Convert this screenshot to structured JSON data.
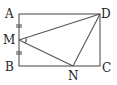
{
  "diagram": {
    "type": "geometry",
    "points": {
      "A": {
        "label": "A",
        "x": 19,
        "y": 14
      },
      "D": {
        "label": "D",
        "x": 100,
        "y": 14
      },
      "B": {
        "label": "B",
        "x": 19,
        "y": 66
      },
      "C": {
        "label": "C",
        "x": 100,
        "y": 66
      },
      "M": {
        "label": "M",
        "x": 19,
        "y": 40
      },
      "N": {
        "label": "N",
        "x": 73,
        "y": 66
      }
    },
    "segments": [
      "AD",
      "DC",
      "CB",
      "BA",
      "MD",
      "MN",
      "ND"
    ],
    "equal_marks": [
      "AM",
      "MB"
    ],
    "angle_marks": [
      "DMN"
    ],
    "colors": {
      "line": "#555555",
      "text": "#222222",
      "background": "#ffffff"
    }
  }
}
